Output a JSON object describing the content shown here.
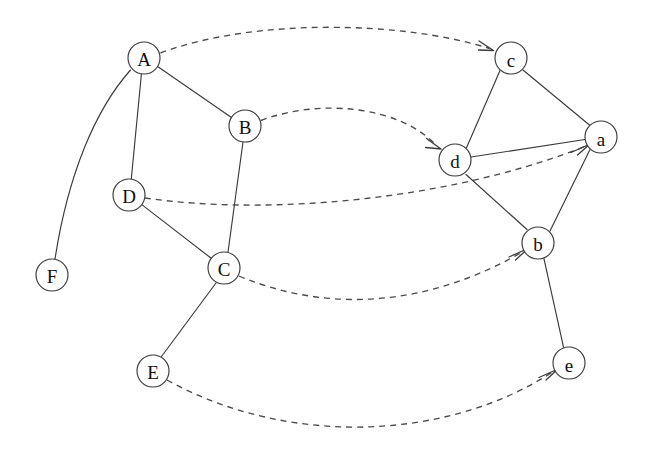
{
  "diagram": {
    "type": "node-link-diagram",
    "canvas": {
      "width": 646,
      "height": 458,
      "background": "#ffffff"
    },
    "style": {
      "node_fill": "#ffffff",
      "node_stroke": "#3a3a3a",
      "solid_edge_color": "#3a3a3a",
      "dashed_edge_color": "#4a4a4a",
      "label_color": "#111111",
      "node_radius": 16
    },
    "groups": [
      {
        "id": "source",
        "name": "uppercase-graph",
        "node_ids": [
          "A",
          "B",
          "C",
          "D",
          "E",
          "F"
        ]
      },
      {
        "id": "target",
        "name": "lowercase-graph",
        "node_ids": [
          "a",
          "b",
          "c",
          "d",
          "e"
        ]
      }
    ],
    "nodes": [
      {
        "id": "A",
        "label": "A",
        "x": 144,
        "y": 58,
        "r": 16,
        "group": "source"
      },
      {
        "id": "B",
        "label": "B",
        "x": 245,
        "y": 126,
        "r": 16,
        "group": "source"
      },
      {
        "id": "D",
        "label": "D",
        "x": 129,
        "y": 195,
        "r": 16,
        "group": "source"
      },
      {
        "id": "C",
        "label": "C",
        "x": 224,
        "y": 268,
        "r": 16,
        "group": "source"
      },
      {
        "id": "E",
        "label": "E",
        "x": 153,
        "y": 371,
        "r": 16,
        "group": "source"
      },
      {
        "id": "F",
        "label": "F",
        "x": 52,
        "y": 275,
        "r": 16,
        "group": "source"
      },
      {
        "id": "c",
        "label": "c",
        "x": 511,
        "y": 58,
        "r": 16,
        "group": "target"
      },
      {
        "id": "a",
        "label": "a",
        "x": 601,
        "y": 137,
        "r": 16,
        "group": "target"
      },
      {
        "id": "d",
        "label": "d",
        "x": 455,
        "y": 160,
        "r": 16,
        "group": "target"
      },
      {
        "id": "b",
        "label": "b",
        "x": 538,
        "y": 243,
        "r": 16,
        "group": "target"
      },
      {
        "id": "e",
        "label": "e",
        "x": 569,
        "y": 363,
        "r": 16,
        "group": "target"
      }
    ],
    "solid_edges": [
      {
        "id": "A-B",
        "from": "A",
        "to": "B",
        "curved": false
      },
      {
        "id": "A-D",
        "from": "A",
        "to": "D",
        "curved": false
      },
      {
        "id": "A-F",
        "from": "A",
        "to": "F",
        "curved": true
      },
      {
        "id": "B-C",
        "from": "B",
        "to": "C",
        "curved": false
      },
      {
        "id": "D-C",
        "from": "D",
        "to": "C",
        "curved": false
      },
      {
        "id": "C-E",
        "from": "C",
        "to": "E",
        "curved": false
      },
      {
        "id": "c-d",
        "from": "c",
        "to": "d",
        "curved": false
      },
      {
        "id": "c-a",
        "from": "c",
        "to": "a",
        "curved": false
      },
      {
        "id": "d-a",
        "from": "d",
        "to": "a",
        "curved": false
      },
      {
        "id": "d-b",
        "from": "d",
        "to": "b",
        "curved": false
      },
      {
        "id": "b-a",
        "from": "b",
        "to": "a",
        "curved": false
      },
      {
        "id": "b-e",
        "from": "b",
        "to": "e",
        "curved": false
      }
    ],
    "mapping_edges": [
      {
        "id": "A-to-c",
        "from": "A",
        "to": "c",
        "style": "dashed",
        "arrow": true
      },
      {
        "id": "B-to-d",
        "from": "B",
        "to": "d",
        "style": "dashed",
        "arrow": true
      },
      {
        "id": "D-to-a",
        "from": "D",
        "to": "a",
        "style": "dashed",
        "arrow": true
      },
      {
        "id": "C-to-b",
        "from": "C",
        "to": "b",
        "style": "dashed",
        "arrow": true
      },
      {
        "id": "E-to-e",
        "from": "E",
        "to": "e",
        "style": "dashed",
        "arrow": true
      }
    ],
    "labels": {
      "A": "A",
      "B": "B",
      "C": "C",
      "D": "D",
      "E": "E",
      "F": "F",
      "a": "a",
      "b": "b",
      "c": "c",
      "d": "d",
      "e": "e"
    }
  }
}
